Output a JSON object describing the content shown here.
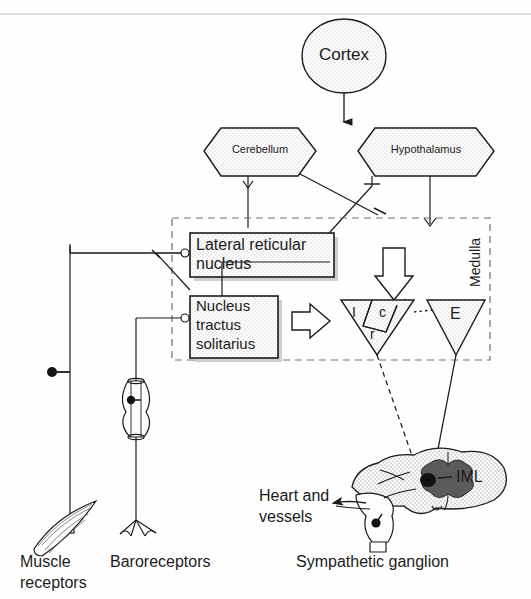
{
  "diagram": {
    "type": "neurophysiology-schematic"
  },
  "nodes": {
    "cortex": {
      "label": "Cortex",
      "shape": "ellipse",
      "fill": "stipple"
    },
    "cerebellum": {
      "label": "Cerebellum",
      "shape": "hexagon",
      "fill": "stipple"
    },
    "hypothalamus": {
      "label": "Hypothalamus",
      "shape": "hexagon",
      "fill": "stipple"
    },
    "lateral_reticular_nucleus": {
      "line1": "Lateral reticular",
      "line2": "nucleus",
      "shape": "rect-shadow",
      "fill": "stipple"
    },
    "nucleus_tractus_solitarius": {
      "line1": "Nucleus",
      "line2": "tractus",
      "line3": "solitarius",
      "shape": "rect-shadow",
      "fill": "stipple"
    },
    "medulla_region": {
      "label": "Medulla",
      "shape": "dashed-rect",
      "label_rotation": "-90"
    },
    "inspiratory_triangle": {
      "fill": "stipple",
      "subregions": [
        {
          "key": "I",
          "label": "I"
        },
        {
          "key": "c",
          "label": "c"
        },
        {
          "key": "r",
          "label": "r"
        }
      ]
    },
    "expiratory_triangle": {
      "label": "E",
      "fill": "stipple"
    },
    "spinal_cord": {
      "label": "IML",
      "fill": "stipple",
      "gray_matter_fill": "dark"
    },
    "sympathetic_ganglion": {
      "label": "Sympathetic ganglion"
    },
    "muscle_receptors": {
      "line1": "Muscle",
      "line2": "receptors"
    },
    "baroreceptors": {
      "label": "Baroreceptors"
    },
    "heart_and_vessels": {
      "line1": "Heart and",
      "line2": "vessels"
    }
  },
  "block_arrows": [
    {
      "name": "descending-block-arrow",
      "direction": "down"
    },
    {
      "name": "nts-to-respiratory-block-arrow",
      "direction": "right"
    }
  ],
  "colors": {
    "stroke": "#1b1b1b",
    "stipple": "#f2f2f2",
    "gray_matter": "#555555",
    "iml_core": "#111111",
    "background": "#fefefe",
    "dashed": "#6e6e6e"
  }
}
